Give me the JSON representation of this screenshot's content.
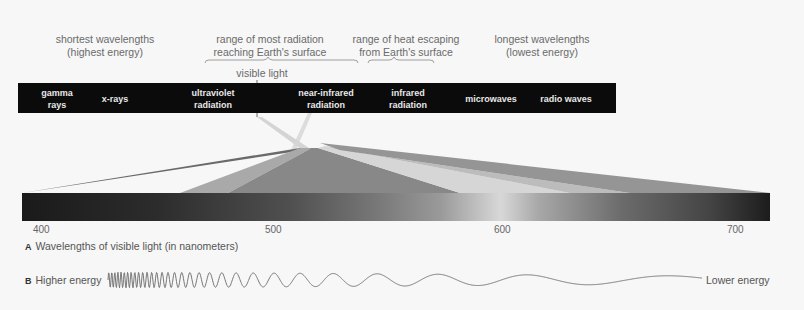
{
  "top_labels": {
    "shortest": [
      "shortest wavelengths",
      "(highest energy)"
    ],
    "most_radiation": [
      "range of most radiation",
      "reaching Earth's surface"
    ],
    "heat_escaping": [
      "range of heat escaping",
      "from Earth's surface"
    ],
    "longest": [
      "longest wavelengths",
      "(lowest energy)"
    ],
    "visible_light": "visible light"
  },
  "spectrum_bands": [
    {
      "line1": "gamma",
      "line2": "rays"
    },
    {
      "line1": "x-rays",
      "line2": ""
    },
    {
      "line1": "ultraviolet",
      "line2": "radiation"
    },
    {
      "line1": "near-infrared",
      "line2": "radiation"
    },
    {
      "line1": "infrared",
      "line2": "radiation"
    },
    {
      "line1": "microwaves",
      "line2": ""
    },
    {
      "line1": "radio waves",
      "line2": ""
    }
  ],
  "visible_axis": {
    "ticks": [
      "400",
      "500",
      "600",
      "700"
    ],
    "unit": "nanometers"
  },
  "captions": {
    "a_letter": "A",
    "a_text": "Wavelengths of visible light (in nanometers)",
    "b_letter": "B",
    "b_left": "Higher energy",
    "b_right": "Lower energy"
  },
  "colors": {
    "bar": "#0b0b0b",
    "band_text": "#e8e8e8",
    "wave": "#777777"
  }
}
